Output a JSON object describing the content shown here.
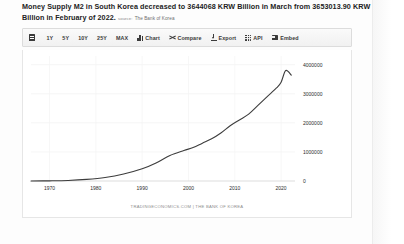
{
  "headline": {
    "text": "Money Supply M2 in South Korea decreased to 3644068 KRW Billion in March from 3653013.90 KRW Billion in February of 2022.",
    "source_label": "source:",
    "source_name": "The Bank of Korea"
  },
  "toolbar": {
    "calendar_icon": "calendar-icon",
    "items": [
      {
        "label": "1Y",
        "icon": null
      },
      {
        "label": "5Y",
        "icon": null
      },
      {
        "label": "10Y",
        "icon": null
      },
      {
        "label": "25Y",
        "icon": null
      },
      {
        "label": "MAX",
        "icon": null
      },
      {
        "label": "Chart",
        "icon": "bar-chart-icon"
      },
      {
        "label": "Compare",
        "icon": "compare-icon"
      },
      {
        "label": "Export",
        "icon": "download-icon"
      },
      {
        "label": "API",
        "icon": "grid-icon"
      },
      {
        "label": "Embed",
        "icon": "embed-icon"
      }
    ]
  },
  "chart_data": {
    "type": "line",
    "title": "Money Supply M2 in South Korea",
    "xlabel": "",
    "ylabel": "",
    "ylim": [
      0,
      4300000
    ],
    "xlim": [
      1966,
      2023
    ],
    "grid": true,
    "legend": null,
    "yticks": [
      "0",
      "1000000",
      "2000000",
      "3000000",
      "4000000"
    ],
    "ytick_values": [
      0,
      1000000,
      2000000,
      3000000,
      4000000
    ],
    "xticks": [
      "1970",
      "1980",
      "1990",
      "2000",
      "2010",
      "2020"
    ],
    "xtick_values": [
      1970,
      1980,
      1990,
      2000,
      2010,
      2020
    ],
    "line_color": "#3d3d3d",
    "series": [
      {
        "name": "Money Supply M2 (KRW Billion)",
        "x": [
          1966,
          1970,
          1974,
          1978,
          1982,
          1986,
          1990,
          1993,
          1996,
          1999,
          2001,
          2003,
          2005,
          2007,
          2009,
          2011,
          2013,
          2015,
          2017,
          2019,
          2020,
          2021,
          2022.2
        ],
        "values": [
          1200,
          5000,
          18000,
          55000,
          120000,
          240000,
          420000,
          620000,
          880000,
          1050000,
          1150000,
          1300000,
          1450000,
          1650000,
          1900000,
          2100000,
          2300000,
          2600000,
          2900000,
          3200000,
          3400000,
          3800000,
          3644068
        ]
      }
    ],
    "last_value": 3644068,
    "last_period": "March",
    "previous_value": 3653013.9,
    "previous_period": "February of 2022",
    "units": "KRW Billion"
  },
  "attribution": "TRADINGECONOMICS.COM | THE BANK OF KOREA"
}
